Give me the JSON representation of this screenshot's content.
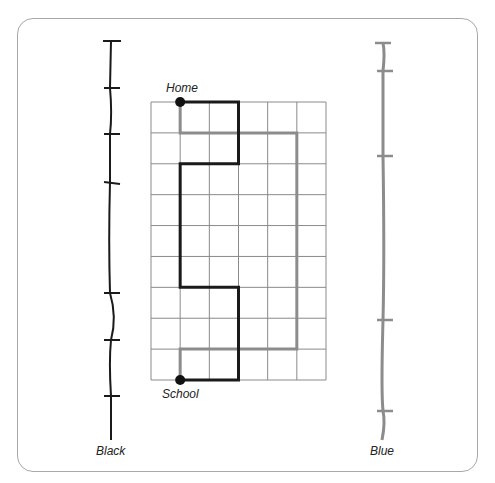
{
  "diagram": {
    "type": "route-comparison-grid",
    "grid": {
      "columns": 6,
      "rows": 9
    },
    "points": {
      "home": {
        "label": "Home",
        "col": 1,
        "row": 0
      },
      "school": {
        "label": "School",
        "col": 1,
        "row": 9
      }
    },
    "routes": [
      {
        "name": "Black",
        "color": "#1a1a1a",
        "path": [
          [
            1,
            0
          ],
          [
            3,
            0
          ],
          [
            3,
            2
          ],
          [
            1,
            2
          ],
          [
            1,
            6
          ],
          [
            3,
            6
          ],
          [
            3,
            9
          ],
          [
            1,
            9
          ]
        ]
      },
      {
        "name": "Blue",
        "color": "#8c8c8c",
        "path": [
          [
            1,
            0
          ],
          [
            1,
            1
          ],
          [
            5,
            1
          ],
          [
            5,
            8
          ],
          [
            1,
            8
          ],
          [
            1,
            9
          ]
        ]
      }
    ],
    "measuring_strings": [
      {
        "label": "Black",
        "color": "#1a1a1a",
        "tick_ys": [
          41,
          88,
          134,
          182,
          293,
          340,
          396
        ]
      },
      {
        "label": "Blue",
        "color": "#8c8c8c",
        "tick_ys": [
          43,
          71,
          156,
          320,
          411
        ]
      }
    ]
  }
}
